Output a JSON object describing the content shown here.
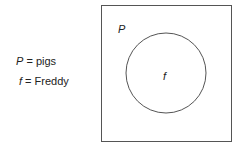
{
  "legend": [
    {
      "symbol": "P",
      "equals": " = ",
      "meaning": "pigs"
    },
    {
      "symbol": "f",
      "equals": " = ",
      "meaning": "Freddy"
    }
  ],
  "diagram": {
    "universe_label": "P",
    "element_label": "f",
    "line_color": "#555555"
  }
}
